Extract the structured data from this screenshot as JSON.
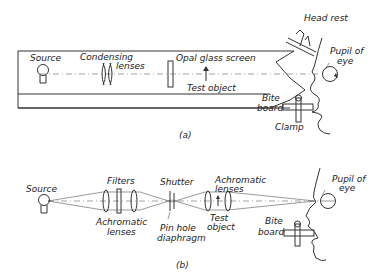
{
  "diagram_a": {
    "caption": "(a)",
    "labels": {
      "source": "Source",
      "condensing_lenses_1": "Condensing",
      "condensing_lenses_2": "lenses",
      "opal_glass_screen": "Opal glass screen",
      "test_object": "Test object",
      "head_rest": "Head rest",
      "pupil_of_eye_1": "Pupil of",
      "pupil_of_eye_2": "eye",
      "bite_board_1": "Bite",
      "bite_board_2": "board",
      "clamp": "Clamp"
    }
  },
  "diagram_b": {
    "caption": "(b)",
    "labels": {
      "source": "Source",
      "filters": "Filters",
      "achromatic_lenses_left_1": "Achromatic",
      "achromatic_lenses_left_2": "lenses",
      "shutter": "Shutter",
      "pinhole_1": "Pin hole",
      "pinhole_2": "diaphragm",
      "achromatic_lenses_right_1": "Achromatic",
      "achromatic_lenses_right_2": "lenses",
      "test_object_1": "Test",
      "test_object_2": "object",
      "pupil_of_eye_1": "Pupil of",
      "pupil_of_eye_2": "eye",
      "bite_board_1": "Bite",
      "bite_board_2": "board"
    }
  }
}
